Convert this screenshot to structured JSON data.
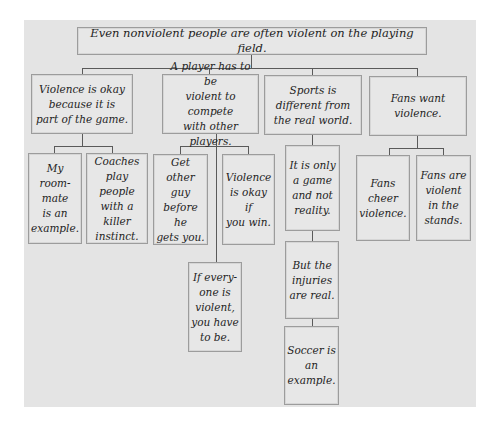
{
  "diagram": {
    "title": "Even nonviolent people are often violent on the playing field.",
    "branches": [
      {
        "label": "Violence is okay\nbecause it is\npart of the game.",
        "children": [
          {
            "label": "My room-\nmate\nis an\nexample."
          },
          {
            "label": "Coaches\nplay people\nwith a\nkiller\ninstinct."
          }
        ]
      },
      {
        "label": "A player has to be\nviolent to compete\nwith other players.",
        "children": [
          {
            "label": "Get other\nguy\nbefore he\ngets you."
          },
          {
            "label": "Violence\nis okay if\nyou win."
          },
          {
            "label": "If every-\none is\nviolent,\nyou have\nto be."
          }
        ]
      },
      {
        "label": "Sports is\ndifferent from\nthe real world.",
        "children": [
          {
            "label": "It is only\na game\nand not\nreality."
          },
          {
            "label": "But the\ninjuries\nare real."
          },
          {
            "label": "Soccer is\nan\nexample."
          }
        ]
      },
      {
        "label": "Fans want\nviolence.",
        "children": [
          {
            "label": "Fans\ncheer\nviolence."
          },
          {
            "label": "Fans are\nviolent\nin the\nstands."
          }
        ]
      }
    ]
  },
  "colors": {
    "panel": "#e4e4e4",
    "box": "#e7e7e7",
    "border": "#9c9c9c",
    "connector": "#5a5a5a",
    "text": "#1e1e1e"
  }
}
